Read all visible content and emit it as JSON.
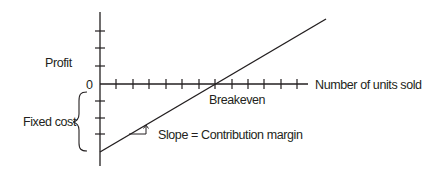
{
  "diagram": {
    "type": "breakeven-chart",
    "labels": {
      "profit": "Profit",
      "zero": "0",
      "x_axis": "Number of units sold",
      "breakeven": "Breakeven",
      "fixed_cost": "Fixed cost",
      "slope": "Slope = Contribution margin"
    },
    "colors": {
      "ink": "#231f20",
      "background": "#ffffff"
    },
    "axes": {
      "origin": [
        100,
        84
      ],
      "y_axis_top": 12,
      "y_axis_bottom": 166,
      "x_axis_end": 308,
      "x_ticks": [
        116,
        133,
        149,
        166,
        182,
        199,
        215,
        232,
        248,
        264,
        281,
        297
      ],
      "y_ticks": [
        31,
        48,
        67,
        101,
        118,
        134
      ]
    },
    "profit_line": {
      "start": [
        100,
        152
      ],
      "end": [
        326,
        19
      ],
      "breakeven_x": 232
    }
  }
}
